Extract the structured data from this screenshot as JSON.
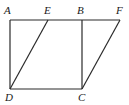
{
  "diagram": {
    "type": "geometry",
    "points": {
      "A": {
        "label": "A",
        "x": 10,
        "y": 20,
        "lx": 4,
        "ly": 14
      },
      "E": {
        "label": "E",
        "x": 48,
        "y": 20,
        "lx": 44,
        "ly": 14
      },
      "B": {
        "label": "B",
        "x": 82,
        "y": 20,
        "lx": 77,
        "ly": 14
      },
      "F": {
        "label": "F",
        "x": 120,
        "y": 20,
        "lx": 116,
        "ly": 14
      },
      "D": {
        "label": "D",
        "x": 10,
        "y": 89,
        "lx": 5,
        "ly": 101
      },
      "C": {
        "label": "C",
        "x": 82,
        "y": 89,
        "lx": 78,
        "ly": 101
      }
    },
    "segments": [
      [
        "A",
        "F"
      ],
      [
        "A",
        "D"
      ],
      [
        "D",
        "C"
      ],
      [
        "B",
        "C"
      ],
      [
        "D",
        "E"
      ],
      [
        "C",
        "F"
      ]
    ],
    "shapes": [
      {
        "name": "square-ABCD",
        "vertices": [
          "A",
          "B",
          "C",
          "D"
        ]
      },
      {
        "name": "parallelogram-EFCD",
        "vertices": [
          "E",
          "F",
          "C",
          "D"
        ]
      }
    ]
  }
}
